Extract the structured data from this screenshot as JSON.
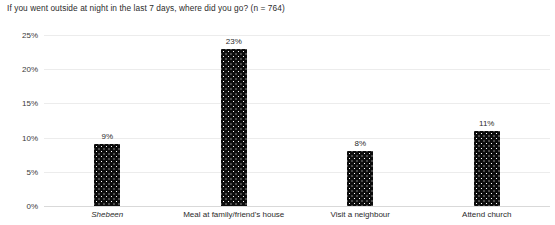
{
  "chart_data": {
    "type": "bar",
    "title": "If you went outside at night in the last 7 days, where did you go? (n = 764)",
    "xlabel": "",
    "ylabel": "",
    "categories": [
      "Shebeen",
      "Meal at family/friend's house",
      "Visit a neighbour",
      "Attend church"
    ],
    "values": [
      9,
      23,
      8,
      11
    ],
    "value_labels": [
      "9%",
      "23%",
      "8%",
      "11%"
    ],
    "ylim": [
      0,
      25
    ],
    "yticks": [
      0,
      5,
      10,
      15,
      20,
      25
    ],
    "ytick_labels": [
      "0%",
      "5%",
      "10%",
      "15%",
      "20%",
      "25%"
    ],
    "grid": true,
    "legend": false,
    "bar_fill": "#0d0d0d",
    "bar_pattern": "white-dots",
    "gridline_color": "#ececec",
    "axis_color": "#d9d9d9",
    "italic_categories": [
      "Shebeen"
    ]
  }
}
